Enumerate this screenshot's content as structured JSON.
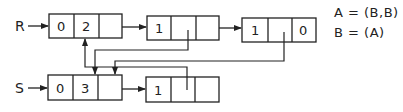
{
  "pointers": [
    {
      "label": "R",
      "x": 18,
      "y": 26
    },
    {
      "label": "S",
      "x": 18,
      "y": 88
    }
  ],
  "nodes": [
    {
      "id": "r1",
      "x": 49,
      "y": 14,
      "cells": [
        "0",
        "2",
        ""
      ]
    },
    {
      "id": "r2",
      "x": 147,
      "y": 16,
      "cells": [
        "1",
        "",
        ""
      ]
    },
    {
      "id": "r3",
      "x": 242,
      "y": 18,
      "cells": [
        "1",
        "",
        "0"
      ]
    },
    {
      "id": "s1",
      "x": 48,
      "y": 75,
      "cells": [
        "0",
        "3",
        ""
      ]
    },
    {
      "id": "s2",
      "x": 146,
      "y": 77,
      "cells": [
        "1",
        "",
        ""
      ]
    }
  ],
  "legend": {
    "line1": "A = (B,B)",
    "line2": "B = (A)"
  },
  "colors": {
    "stroke": "#222222",
    "background": "#ffffff"
  }
}
